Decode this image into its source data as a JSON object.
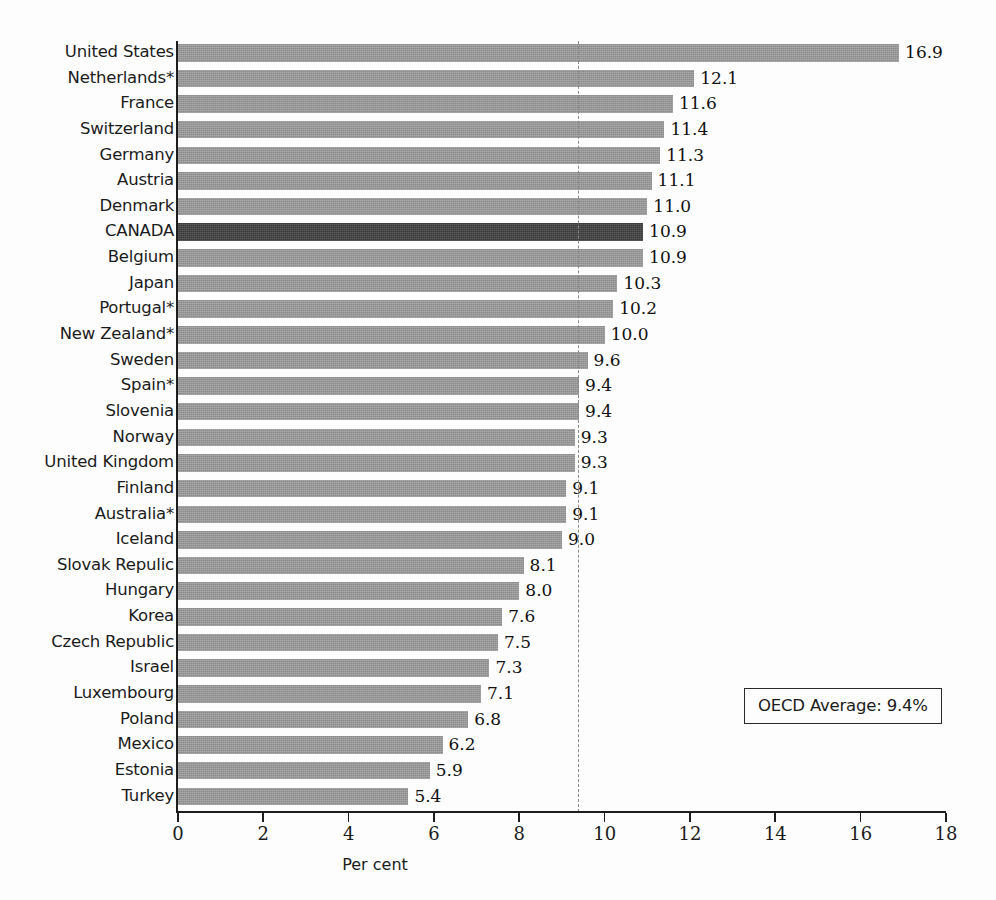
{
  "chart": {
    "type": "bar",
    "orientation": "horizontal",
    "xlabel": "Per cent",
    "ylabel": "",
    "title": "",
    "xlim": [
      0,
      18
    ],
    "xticks": [
      "0",
      "2",
      "4",
      "6",
      "8",
      "10",
      "12",
      "14",
      "16",
      "18"
    ],
    "grid": false,
    "legend_position": "inside-bottom-right",
    "annotation_label": "OECD Average: 9.4%",
    "average_line_value": 9.4,
    "bar_color": "#8c8c8c",
    "highlight_color": "#3a3a3a",
    "axis_color": "#1d1d1d",
    "average_line_color": "#8a8a8a",
    "background_color": "#fdfdfd"
  },
  "chart_data": {
    "type": "bar",
    "title": "",
    "xlabel": "Per cent",
    "ylabel": "",
    "xlim": [
      0,
      18
    ],
    "xticks": [
      0,
      2,
      4,
      6,
      8,
      10,
      12,
      14,
      16,
      18
    ],
    "grid": false,
    "orientation": "horizontal",
    "annotations": [
      "OECD Average: 9.4%"
    ],
    "reference_lines": [
      {
        "value": 9.4,
        "style": "dashed",
        "label": "OECD Average: 9.4%"
      }
    ],
    "highlight_category": "CANADA",
    "categories": [
      "United States",
      "Netherlands*",
      "France",
      "Switzerland",
      "Germany",
      "Austria",
      "Denmark",
      "CANADA",
      "Belgium",
      "Japan",
      "Portugal*",
      "New Zealand*",
      "Sweden",
      "Spain*",
      "Slovenia",
      "Norway",
      "United Kingdom",
      "Finland",
      "Australia*",
      "Iceland",
      "Slovak Repulic",
      "Hungary",
      "Korea",
      "Czech Republic",
      "Israel",
      "Luxembourg",
      "Poland",
      "Mexico",
      "Estonia",
      "Turkey"
    ],
    "values": [
      16.9,
      12.1,
      11.6,
      11.4,
      11.3,
      11.1,
      11.0,
      10.9,
      10.9,
      10.3,
      10.2,
      10.0,
      9.6,
      9.4,
      9.4,
      9.3,
      9.3,
      9.1,
      9.1,
      9.0,
      8.1,
      8.0,
      7.6,
      7.5,
      7.3,
      7.1,
      6.8,
      6.2,
      5.9,
      5.4
    ],
    "value_labels": [
      "16.9",
      "12.1",
      "11.6",
      "11.4",
      "11.3",
      "11.1",
      "11.0",
      "10.9",
      "10.9",
      "10.3",
      "10.2",
      "10.0",
      "9.6",
      "9.4",
      "9.4",
      "9.3",
      "9.3",
      "9.1",
      "9.1",
      "9.0",
      "8.1",
      "8.0",
      "7.6",
      "7.5",
      "7.3",
      "7.1",
      "6.8",
      "6.2",
      "5.9",
      "5.4"
    ]
  }
}
